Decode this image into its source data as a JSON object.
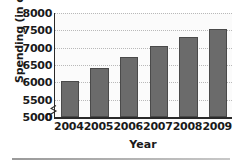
{
  "chart_data": {
    "type": "bar",
    "title": "",
    "xlabel": "Year",
    "ylabel": "Spending (in dollars)",
    "categories": [
      "2004",
      "2005",
      "2006",
      "2007",
      "2008",
      "2009"
    ],
    "values": [
      6050,
      6400,
      6730,
      7050,
      7300,
      7550
    ],
    "ylim": [
      5000,
      8000
    ],
    "y_axis_break": true,
    "y_zero_tick": "0",
    "yticks": [
      "0",
      "5000",
      "5500",
      "6000",
      "6500",
      "7000",
      "7500",
      "8000"
    ],
    "ytick_values": [
      0,
      5000,
      5500,
      6000,
      6500,
      7000,
      7500,
      8000
    ],
    "grid": true,
    "legend": "none",
    "bar_color": "#6b6b6b",
    "bar_edge_color": "#4a4a4a",
    "plot_background": "#fbfbfb",
    "gridline_color": "#b9b9b9",
    "axis_color": "#2a2a2a",
    "text_color": "#1a1a1a"
  },
  "axis_break": {
    "name": "axis-break-symbol",
    "position": "y-axis between 0 and 5000"
  }
}
